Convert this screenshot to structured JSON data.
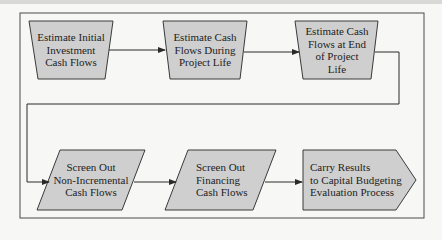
{
  "diagram": {
    "type": "flowchart",
    "colors": {
      "shape_fill": "#cfcfcf",
      "stroke": "#3a3a3a",
      "frame": "#4a4a4a",
      "background": "#f7f7f5"
    },
    "nodes": [
      {
        "id": "n1",
        "shape": "trapezoid",
        "label": "Estimate Initial Investment Cash Flows",
        "lines": [
          "Estimate Initial",
          "Investment",
          "Cash Flows"
        ]
      },
      {
        "id": "n2",
        "shape": "trapezoid",
        "label": "Estimate Cash Flows During Project Life",
        "lines": [
          "Estimate Cash",
          "Flows During",
          "Project Life"
        ]
      },
      {
        "id": "n3",
        "shape": "trapezoid",
        "label": "Estimate Cash Flows at End of Project Life",
        "lines": [
          "Estimate Cash",
          "Flows at End",
          "of Project",
          "Life"
        ]
      },
      {
        "id": "n4",
        "shape": "parallelogram",
        "label": "Screen Out Non-Incremental Cash Flows",
        "lines": [
          "Screen Out",
          "Non-Incremental",
          "Cash Flows"
        ]
      },
      {
        "id": "n5",
        "shape": "parallelogram",
        "label": "Screen Out Financing Cash Flows",
        "lines": [
          "Screen Out",
          "Financing",
          "Cash Flows"
        ]
      },
      {
        "id": "n6",
        "shape": "pentagon-arrow",
        "label": "Carry Results to Capital Budgeting Evaluation Process",
        "lines": [
          "Carry Results",
          "to Capital Budgeting",
          "Evaluation Process"
        ]
      }
    ],
    "edges": [
      {
        "from": "n1",
        "to": "n2"
      },
      {
        "from": "n2",
        "to": "n3"
      },
      {
        "from": "n3",
        "to": "n4"
      },
      {
        "from": "n4",
        "to": "n5"
      },
      {
        "from": "n5",
        "to": "n6"
      }
    ]
  }
}
